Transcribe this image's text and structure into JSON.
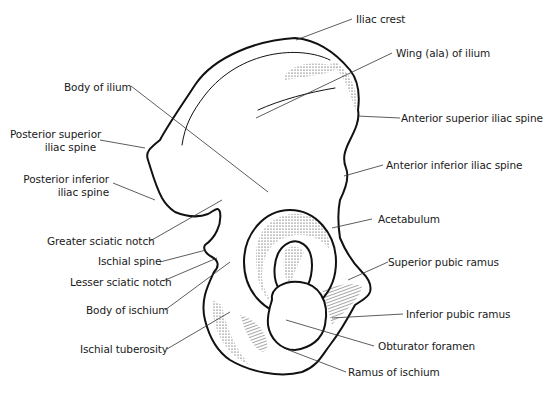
{
  "labels": {
    "iliac_crest": "Iliac crest",
    "wing_of_ilium": "Wing (ala) of ilium",
    "body_of_ilium": "Body of ilium",
    "anterior_superior_iliac_spine": "Anterior superior iliac spine",
    "posterior_superior_iliac_spine_1": "Posterior superior",
    "posterior_superior_iliac_spine_2": "iliac spine",
    "anterior_inferior_iliac_spine": "Anterior inferior iliac spine",
    "posterior_inferior_iliac_spine_1": "Posterior inferior",
    "posterior_inferior_iliac_spine_2": "iliac spine",
    "acetabulum": "Acetabulum",
    "greater_sciatic_notch": "Greater sciatic notch",
    "ischial_spine": "Ischial spine",
    "superior_pubic_ramus": "Superior pubic ramus",
    "lesser_sciatic_notch": "Lesser sciatic notch",
    "body_of_ischium": "Body of ischium",
    "inferior_pubic_ramus": "Inferior pubic ramus",
    "obturator_foramen": "Obturator foramen",
    "ischial_tuberosity": "Ischial tuberosity",
    "ramus_of_ischium": "Ramus of ischium"
  },
  "colors": {
    "ink": "#111111",
    "background": "#ffffff"
  }
}
